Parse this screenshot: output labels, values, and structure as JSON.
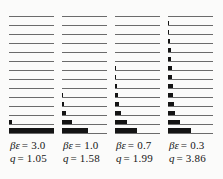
{
  "figure": {
    "background": "#fbfbfa",
    "bar_color": "#141414",
    "line_color": "#6b6b6b"
  },
  "chart_data": {
    "type": "bar",
    "orientation": "horizontal",
    "title": "",
    "levels_per_panel": 14,
    "value_scale": "bar length as fraction of panel width, level 1 = top, level 14 = bottom (ground state)",
    "panels": [
      {
        "beta_symbol": "βε",
        "beta_eq_value": "= 3.0",
        "q_symbol": "q",
        "q_eq_value": "= 1.05",
        "beta_epsilon": 3.0,
        "q": 1.05,
        "values": [
          0,
          0,
          0,
          0,
          0,
          0,
          0,
          0,
          0,
          0,
          0,
          0,
          0.07,
          1.0
        ]
      },
      {
        "beta_symbol": "βε",
        "beta_eq_value": "= 1.0",
        "q_symbol": "q",
        "q_eq_value": "= 1.58",
        "beta_epsilon": 1.0,
        "q": 1.58,
        "values": [
          0,
          0,
          0,
          0,
          0,
          0,
          0,
          0,
          0,
          0.02,
          0.05,
          0.09,
          0.23,
          0.57
        ]
      },
      {
        "beta_symbol": "βε",
        "beta_eq_value": "= 0.7",
        "q_symbol": "q",
        "q_eq_value": "= 1.99",
        "beta_epsilon": 0.7,
        "q": 1.99,
        "values": [
          0,
          0,
          0,
          0,
          0,
          0,
          0.02,
          0.03,
          0.05,
          0.07,
          0.09,
          0.14,
          0.27,
          0.48
        ]
      },
      {
        "beta_symbol": "βε",
        "beta_eq_value": "= 0.3",
        "q_symbol": "q",
        "q_eq_value": "= 3.86",
        "beta_epsilon": 0.3,
        "q": 3.86,
        "values": [
          0,
          0.02,
          0.03,
          0.05,
          0.06,
          0.07,
          0.08,
          0.09,
          0.11,
          0.12,
          0.14,
          0.16,
          0.27,
          0.5
        ]
      }
    ]
  }
}
